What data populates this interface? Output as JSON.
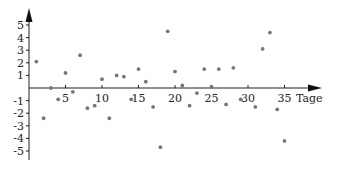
{
  "chart_data": {
    "type": "scatter",
    "title": "",
    "xlabel": "Tage",
    "ylabel": "",
    "xlim": [
      0,
      38
    ],
    "ylim": [
      -5.5,
      5.5
    ],
    "grid": false,
    "legend": null,
    "x_ticks": [
      5,
      10,
      15,
      20,
      25,
      30,
      35
    ],
    "y_ticks": [
      -5,
      -4,
      -3,
      -2,
      -1,
      1,
      2,
      3,
      4,
      5
    ],
    "marker_color": "#777777",
    "x": [
      1,
      2,
      3,
      4,
      5,
      6,
      7,
      8,
      9,
      10,
      11,
      12,
      13,
      14,
      15,
      16,
      17,
      18,
      19,
      20,
      21,
      22,
      23,
      24,
      25,
      26,
      27,
      28,
      29,
      31,
      32,
      33,
      34,
      35
    ],
    "y": [
      2.1,
      -2.4,
      0.0,
      -0.9,
      1.2,
      -0.3,
      2.6,
      -1.6,
      -1.4,
      0.7,
      -2.4,
      1.0,
      0.9,
      -0.9,
      1.5,
      0.5,
      -1.5,
      -4.7,
      4.5,
      1.3,
      0.2,
      -1.4,
      -0.4,
      1.5,
      0.1,
      1.5,
      -1.3,
      1.6,
      -0.9,
      -1.5,
      3.1,
      4.4,
      -1.7,
      -4.2
    ]
  }
}
